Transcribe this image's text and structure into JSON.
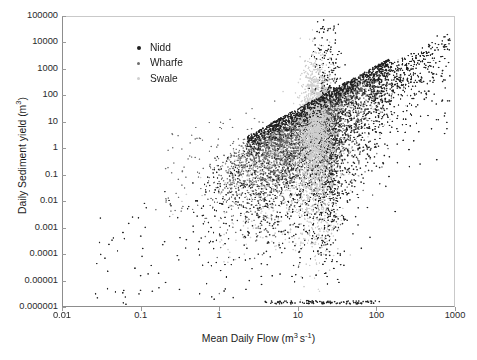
{
  "chart_data": {
    "type": "scatter",
    "title": "",
    "xlabel": "Mean Daily Flow (m3 s-1)",
    "ylabel": "Daily Sediment yield (m3)",
    "xscale": "log",
    "yscale": "log",
    "xlim": [
      0.01,
      1000
    ],
    "ylim": [
      1e-06,
      100000
    ],
    "grid": false,
    "legend_position": "upper-left-inside",
    "xticks": [
      "0.01",
      "0.1",
      "1",
      "10",
      "100",
      "1000"
    ],
    "xtick_values": [
      0.01,
      0.1,
      1,
      10,
      100,
      1000
    ],
    "yticks": [
      "100000",
      "10000",
      "1000",
      "100",
      "10",
      "1",
      "0.1",
      "0.01",
      "0.001",
      "0.0001",
      "0.00001",
      "0.000001"
    ],
    "ytick_values": [
      100000,
      10000,
      1000,
      100,
      10,
      1,
      0.1,
      0.01,
      0.001,
      0.0001,
      1e-05,
      1e-06
    ],
    "series": [
      {
        "name": "Nidd",
        "color": "#1f1f1f",
        "marker": "dot",
        "marker_size": 1.6,
        "n_points": 3400,
        "description": "Dark points: broadest spread, forms the rising upper envelope from flow 1 to 800 and a dense dark vertical streak near flow 20-35 extending down to 0.000001",
        "x_center_log": 1.25,
        "x_spread_log": 0.58,
        "y_center_log": 1.35,
        "y_spread_log": 2.1,
        "slope": 2.35
      },
      {
        "name": "Wharfe",
        "color": "#6e6e6e",
        "marker": "dot",
        "marker_size": 1.5,
        "n_points": 2600,
        "description": "Mid-grey points: dense core cloud centred near flow 8-30, sediment yield 10-1000, overlapping the Nidd cloud",
        "x_center_log": 1.12,
        "x_spread_log": 0.42,
        "y_center_log": 1.9,
        "y_spread_log": 1.45,
        "slope": 2.2
      },
      {
        "name": "Swale",
        "color": "#cfcfcf",
        "marker": "dot",
        "marker_size": 1.6,
        "n_points": 2300,
        "description": "Light-grey points: compact near-vertical band at flow 12-30 spanning sediment yield 0.001 to 400, plus a diffuse halo",
        "x_center_log": 1.25,
        "x_spread_log": 0.17,
        "y_center_log": 0.9,
        "y_spread_log": 1.7,
        "slope": 1.1
      }
    ],
    "annotations": [
      "Dense upper envelope rises log-linearly from (1, 0.1) to (800, 10000)",
      "Sparse isolated points in lower-left from flow 0.02 to 3, yield 0.000002 to 1"
    ]
  },
  "legend": {
    "items": [
      {
        "label": "Nidd",
        "color": "#1f1f1f",
        "size": 4.0
      },
      {
        "label": "Wharfe",
        "color": "#6e6e6e",
        "size": 3.1
      },
      {
        "label": "Swale",
        "color": "#cfcfcf",
        "size": 3.4
      }
    ]
  },
  "axis_titles": {
    "x_prefix": "Mean Daily Flow (m",
    "x_sup1": "3",
    "x_mid": "s",
    "x_sup2": "-1",
    "x_suffix": ")",
    "y_prefix": "Daily Sediment yield (m",
    "y_sup": "3",
    "y_suffix": ")"
  }
}
